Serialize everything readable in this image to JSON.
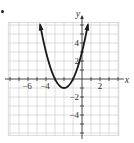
{
  "bullet": "•",
  "chart_data": {
    "type": "line",
    "title": "",
    "xlabel": "x",
    "ylabel": "y",
    "xlim": [
      -8.2,
      4.1
    ],
    "ylim": [
      -6.3,
      6.3
    ],
    "grid": true,
    "x_ticks": [
      -6,
      -4,
      2
    ],
    "y_ticks": [
      4,
      2,
      -2,
      -4
    ],
    "x_tick_labels": [
      "−6",
      "−4",
      "2"
    ],
    "y_tick_labels": [
      "4",
      "2",
      "−2",
      "−4"
    ],
    "series": [
      {
        "name": "parabola",
        "equation": "y = (x + 2)^2 - 1",
        "vertex": [
          -2,
          -1
        ],
        "x_intercepts": [
          -3,
          -1
        ],
        "y_intercept": 3,
        "x_range": [
          -4.66,
          0.66
        ],
        "arrows": "both ends",
        "color": "#1a1a1a"
      }
    ]
  },
  "colors": {
    "grid": "#c8c8c8",
    "axis": "#333333",
    "curve": "#1a1a1a",
    "text": "#333333"
  }
}
